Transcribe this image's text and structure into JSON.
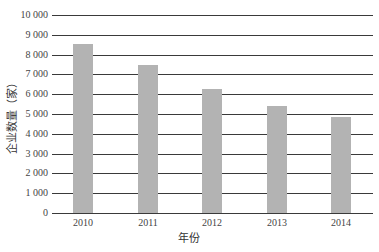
{
  "chart_data": {
    "type": "bar",
    "title": "",
    "xlabel": "年份",
    "ylabel": "企业数量（家）",
    "categories": [
      "2010",
      "2011",
      "2012",
      "2013",
      "2014"
    ],
    "values": [
      8550,
      7450,
      6250,
      5400,
      4850
    ],
    "ylim": [
      0,
      10000
    ],
    "yticks": [
      "0",
      "1 000",
      "2 000",
      "3 000",
      "4 000",
      "5 000",
      "6 000",
      "7 000",
      "8 000",
      "9 000",
      "10 000"
    ],
    "grid": true,
    "legend": null,
    "bar_color": "#b3b3b3"
  }
}
